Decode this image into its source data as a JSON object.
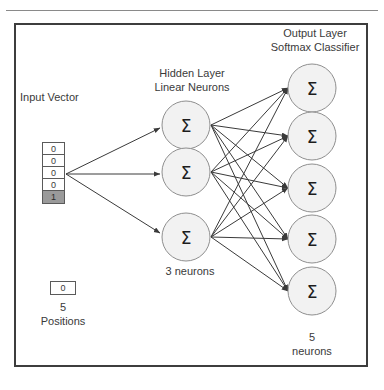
{
  "figure": {
    "title_input": "Input Vector",
    "title_hidden_line1": "Hidden Layer",
    "title_hidden_line2": "Linear Neurons",
    "title_output_line1": "Output Layer",
    "title_output_line2": "Softmax Classifier",
    "hidden_count_label": "3 neurons",
    "output_count_line1": "5",
    "output_count_line2": "neurons",
    "positions_line1": "5",
    "positions_line2": "Positions",
    "legend_cell_value": "0",
    "neuron_symbol": "Σ",
    "colors": {
      "frame_border": "#3d3d3d",
      "neuron_fill": "#f2f2f2",
      "neuron_stroke": "#8f8f8f",
      "edge": "#3a3a3a",
      "highlight_cell": "#9a9a9a",
      "text": "#3a3a3a",
      "background": "#ffffff"
    }
  },
  "input_vector": {
    "cells": [
      {
        "value": "0",
        "highlighted": false
      },
      {
        "value": "0",
        "highlighted": false
      },
      {
        "value": "0",
        "highlighted": false
      },
      {
        "value": "0",
        "highlighted": false
      },
      {
        "value": "1",
        "highlighted": true
      }
    ]
  },
  "hidden_layer": {
    "neurons": [
      {
        "symbol": "Σ"
      },
      {
        "symbol": "Σ"
      },
      {
        "symbol": "Σ"
      }
    ]
  },
  "output_layer": {
    "neurons": [
      {
        "symbol": "Σ"
      },
      {
        "symbol": "Σ"
      },
      {
        "symbol": "Σ"
      },
      {
        "symbol": "Σ"
      },
      {
        "symbol": "Σ"
      }
    ]
  }
}
